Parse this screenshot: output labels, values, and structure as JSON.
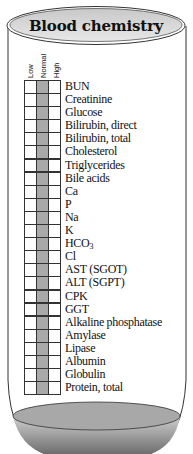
{
  "title": "Blood chemistry",
  "columns": [
    {
      "key": "low",
      "label": "Low"
    },
    {
      "key": "normal",
      "label": "Normal"
    },
    {
      "key": "high",
      "label": "High"
    }
  ],
  "shaded_column": "normal",
  "colors": {
    "normal_column": "#a9a9a9",
    "liquid_top": "#a8a8a8",
    "liquid_bottom": "#7a7a7a",
    "cap": "#d9d9d9"
  },
  "tests": [
    {
      "label": "BUN"
    },
    {
      "label": "Creatinine"
    },
    {
      "label": "Glucose"
    },
    {
      "label": "Bilirubin, direct"
    },
    {
      "label": "Bilirubin, total"
    },
    {
      "label": "Cholesterol"
    },
    {
      "label": "Triglycerides"
    },
    {
      "label": "Bile acids"
    },
    {
      "label": "Ca"
    },
    {
      "label": "P"
    },
    {
      "label": "Na"
    },
    {
      "label": "K"
    },
    {
      "label": "HCO",
      "sub": "3"
    },
    {
      "label": "Cl"
    },
    {
      "label": "AST (SGOT)"
    },
    {
      "label": "ALT (SGPT)"
    },
    {
      "label": "CPK"
    },
    {
      "label": "GGT"
    },
    {
      "label": "Alkaline phosphatase"
    },
    {
      "label": "Amylase"
    },
    {
      "label": "Lipase"
    },
    {
      "label": "Albumin"
    },
    {
      "label": "Globulin"
    },
    {
      "label": "Protein, total"
    }
  ]
}
